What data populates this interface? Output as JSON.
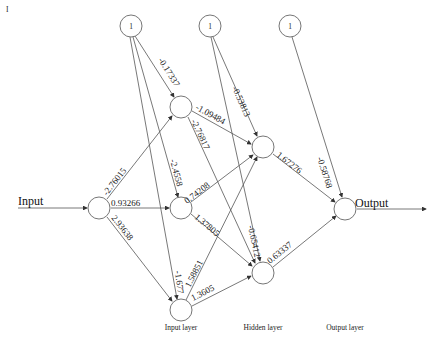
{
  "diagram": {
    "type": "neural-network",
    "io": {
      "input_label": "Input",
      "output_label": "Output"
    },
    "layer_labels": {
      "input": "Input layer",
      "hidden": "Hidden layer",
      "output": "Output layer"
    },
    "bias_label": "1",
    "corner_mark": "I",
    "weights": {
      "in_h1a": "-2.76015",
      "in_h1b": "0.93266",
      "in_h1c": "2.93638",
      "b1_h1a": "-0.17337",
      "b1_h1b": "-2.4558",
      "b1_h1c": "-1.677",
      "h1a_h2a": "-1.09484",
      "h1a_h2b": "-2.76817",
      "h1b_h2a": "0.74208",
      "h1b_h2b": "1.37805",
      "h1c_h2a": "1.58851",
      "h1c_h2b": "1.3605",
      "b2_h2a": "-0.53813",
      "b2_h2b": "-0.65412",
      "h2a_out": "1.67276",
      "h2b_out": "0.63337",
      "b3_out": "-0.58768"
    }
  }
}
